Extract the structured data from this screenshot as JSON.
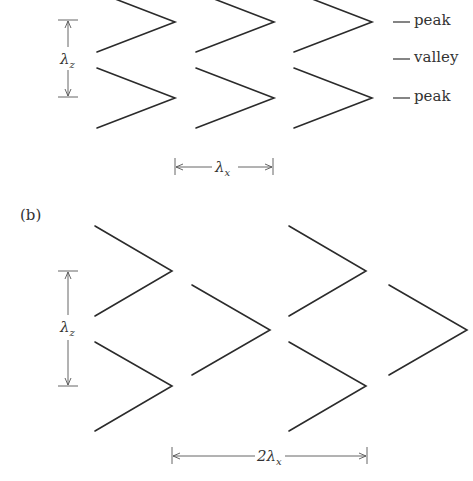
{
  "figure": {
    "panel_a": {
      "legend": [
        "peak",
        "valley",
        "peak"
      ],
      "legend_dash": "—",
      "dim_vertical": "λz",
      "dim_horizontal": "λx",
      "columns": 3,
      "rows": 2
    },
    "panel_b": {
      "label": "(b)",
      "dim_vertical": "λz",
      "dim_horizontal": "2λx",
      "columns": 4,
      "rows": 2,
      "arrangement": "staggered"
    },
    "colors": {
      "line": "#2b2b2b",
      "dimension": "#555555",
      "text": "#333333",
      "background": "#ffffff"
    }
  }
}
